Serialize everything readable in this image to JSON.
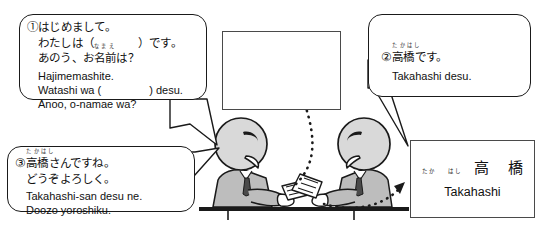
{
  "scene": {
    "description": "Japanese textbook illustration: two business people exchanging meishi (name cards) while greeting each other",
    "colors": {
      "ink": "#1a1a1a",
      "paper": "#ffffff",
      "figure_fill": "#d9d9d9",
      "suit_fill": "#bdbdbd",
      "card_border": "#4a4a4a"
    }
  },
  "bubbles": [
    {
      "id": "bubble-1",
      "marker": "①",
      "jp_lines": [
        "①はじめまして。",
        "わたしは（　　　　）です。",
        "あのう、お名前は？"
      ],
      "jp_line1": "はじめまして。",
      "jp_line2_a": "わたしは（",
      "jp_line2_b": "）です。",
      "jp_line3_a": "あのう、お",
      "jp_line3_kanji": "名前",
      "jp_line3_furigana": "なまえ",
      "jp_line3_b": "は？",
      "ro_lines": [
        "Hajimemashite.",
        "Watashi wa (          ) desu.",
        "Anoo, o-namae wa?"
      ],
      "ro_line1": "Hajimemashite.",
      "ro_line2_a": "Watashi wa (",
      "ro_line2_b": ") desu.",
      "ro_line3": "Anoo, o-namae wa?"
    },
    {
      "id": "bubble-2",
      "marker": "②",
      "jp_prefix": "②",
      "jp_kanji": "高橋",
      "jp_furigana": "たかはし",
      "jp_suffix": "です。",
      "ro_line": "Takahashi desu."
    },
    {
      "id": "bubble-3",
      "marker": "③",
      "jp_prefix": "③",
      "jp_kanji": "高橋",
      "jp_furigana": "たかはし",
      "jp_suffix": "さんですね。",
      "jp_line2": "どうぞよろしく。",
      "ro_line1": "Takahashi-san desu ne.",
      "ro_line2": "Doozo yoroshiku."
    }
  ],
  "blank_card": {
    "label": "",
    "note": "empty name card outline"
  },
  "name_card": {
    "kanji": "高 橋",
    "furigana_1": "たか",
    "furigana_2": "はし",
    "romaji": "Takahashi"
  }
}
